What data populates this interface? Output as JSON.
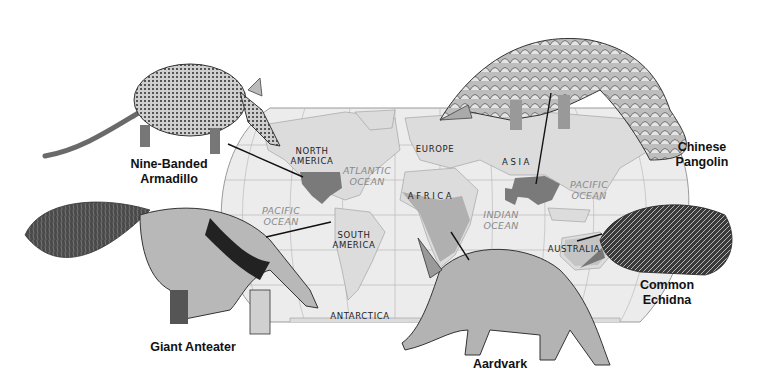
{
  "figure": {
    "colors": {
      "background": "#ffffff",
      "ocean": "#eaeaea",
      "land": "#dedede",
      "range_highlight": "#7f7f7f",
      "africa_range": "#b3b3b3",
      "grid_lines": "#a8a8a8",
      "leader_lines": "#111111",
      "ocean_text": "#8a8a8a",
      "continent_text": "#222222"
    }
  },
  "animals": [
    {
      "id": "armadillo",
      "name_line1": "Nine-Banded",
      "name_line2": "Armadillo",
      "range": "North America"
    },
    {
      "id": "pangolin",
      "name_line1": "Chinese",
      "name_line2": "Pangolin",
      "range": "Asia"
    },
    {
      "id": "anteater",
      "name_line1": "Giant Anteater",
      "name_line2": "",
      "range": "South America"
    },
    {
      "id": "aardvark",
      "name_line1": "Aardvark",
      "name_line2": "",
      "range": "Africa"
    },
    {
      "id": "echidna",
      "name_line1": "Common",
      "name_line2": "Echidna",
      "range": "Australia"
    }
  ],
  "continents": {
    "north_america_1": "NORTH",
    "north_america_2": "AMERICA",
    "south_america_1": "SOUTH",
    "south_america_2": "AMERICA",
    "europe": "EUROPE",
    "asia": "ASIA",
    "africa": "AFRICA",
    "australia": "AUSTRALIA",
    "antarctica": "ANTARCTICA"
  },
  "oceans": {
    "atlantic_1": "ATLANTIC",
    "atlantic_2": "OCEAN",
    "pacific_west_1": "PACIFIC",
    "pacific_west_2": "OCEAN",
    "pacific_east_1": "PACIFIC",
    "pacific_east_2": "OCEAN",
    "indian_1": "INDIAN",
    "indian_2": "OCEAN"
  }
}
